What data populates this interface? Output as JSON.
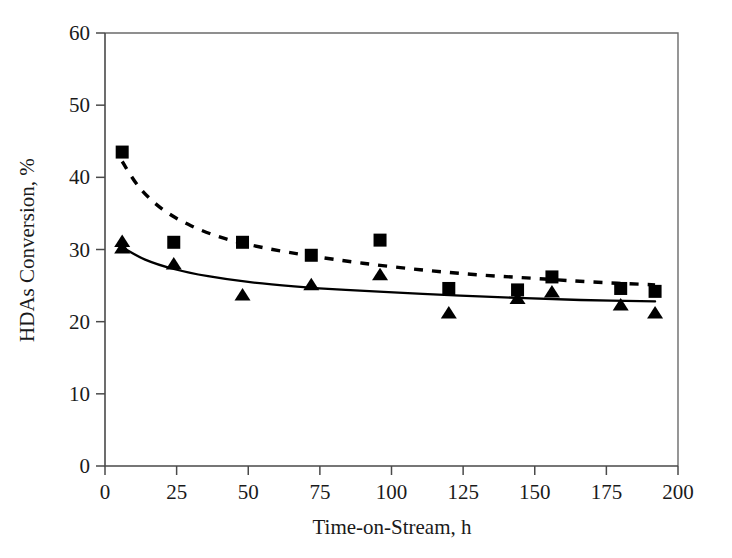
{
  "chart_data": {
    "type": "scatter",
    "title": "",
    "xlabel": "Time-on-Stream, h",
    "ylabel": "HDAs Conversion, %",
    "xlim": [
      0,
      200
    ],
    "ylim": [
      0,
      60
    ],
    "xticks": [
      0,
      25,
      50,
      75,
      100,
      125,
      150,
      175,
      200
    ],
    "yticks": [
      0,
      10,
      20,
      30,
      40,
      50,
      60
    ],
    "xtick_labels": [
      "0",
      "25",
      "50",
      "75",
      "100",
      "125",
      "150",
      "175",
      "200"
    ],
    "ytick_labels": [
      "0",
      "10",
      "20",
      "30",
      "40",
      "50",
      "60"
    ],
    "grid": false,
    "legend": "none",
    "series": [
      {
        "name": "Series A (squares, dashed trend)",
        "marker": "square",
        "linestyle": "dashed",
        "color": "#000000",
        "points": [
          {
            "x": 6,
            "y": 43.5
          },
          {
            "x": 24,
            "y": 31.0
          },
          {
            "x": 48,
            "y": 31.0
          },
          {
            "x": 72,
            "y": 29.2
          },
          {
            "x": 96,
            "y": 31.3
          },
          {
            "x": 120,
            "y": 24.6
          },
          {
            "x": 144,
            "y": 24.4
          },
          {
            "x": 156,
            "y": 26.2
          },
          {
            "x": 180,
            "y": 24.6
          },
          {
            "x": 192,
            "y": 24.2
          }
        ],
        "trend": [
          {
            "x": 6,
            "y": 42.2
          },
          {
            "x": 12,
            "y": 38.6
          },
          {
            "x": 20,
            "y": 35.6
          },
          {
            "x": 30,
            "y": 33.3
          },
          {
            "x": 42,
            "y": 31.5
          },
          {
            "x": 56,
            "y": 30.2
          },
          {
            "x": 72,
            "y": 29.1
          },
          {
            "x": 90,
            "y": 28.1
          },
          {
            "x": 110,
            "y": 27.2
          },
          {
            "x": 130,
            "y": 26.5
          },
          {
            "x": 150,
            "y": 26.0
          },
          {
            "x": 170,
            "y": 25.5
          },
          {
            "x": 192,
            "y": 25.1
          }
        ]
      },
      {
        "name": "Series B (triangles, solid trend)",
        "marker": "triangle",
        "linestyle": "solid",
        "color": "#000000",
        "points": [
          {
            "x": 6,
            "y": 31.0
          },
          {
            "x": 6,
            "y": 30.1
          },
          {
            "x": 24,
            "y": 27.9
          },
          {
            "x": 48,
            "y": 23.6
          },
          {
            "x": 72,
            "y": 25.0
          },
          {
            "x": 96,
            "y": 26.4
          },
          {
            "x": 120,
            "y": 21.1
          },
          {
            "x": 144,
            "y": 23.1
          },
          {
            "x": 156,
            "y": 24.0
          },
          {
            "x": 180,
            "y": 22.2
          },
          {
            "x": 192,
            "y": 21.1
          }
        ],
        "trend": [
          {
            "x": 6,
            "y": 30.3
          },
          {
            "x": 14,
            "y": 28.6
          },
          {
            "x": 24,
            "y": 27.3
          },
          {
            "x": 36,
            "y": 26.3
          },
          {
            "x": 50,
            "y": 25.5
          },
          {
            "x": 66,
            "y": 24.9
          },
          {
            "x": 84,
            "y": 24.4
          },
          {
            "x": 104,
            "y": 24.0
          },
          {
            "x": 124,
            "y": 23.6
          },
          {
            "x": 144,
            "y": 23.3
          },
          {
            "x": 166,
            "y": 23.0
          },
          {
            "x": 192,
            "y": 22.8
          }
        ]
      }
    ]
  }
}
